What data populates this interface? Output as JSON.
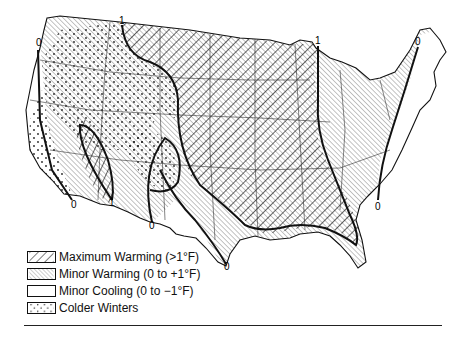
{
  "map": {
    "subject": "Contiguous United States temperature change zones",
    "contour_labels": [
      {
        "text": "0",
        "x": 39,
        "y": 46
      },
      {
        "text": "1",
        "x": 122,
        "y": 25
      },
      {
        "text": "1",
        "x": 318,
        "y": 44
      },
      {
        "text": "0",
        "x": 418,
        "y": 45
      },
      {
        "text": "0",
        "x": 74,
        "y": 205
      },
      {
        "text": "1",
        "x": 112,
        "y": 203
      },
      {
        "text": "0",
        "x": 152,
        "y": 226
      },
      {
        "text": "0",
        "x": 378,
        "y": 207
      },
      {
        "text": "0",
        "x": 227,
        "y": 267
      }
    ],
    "colors": {
      "line": "#111111",
      "background": "#ffffff"
    }
  },
  "legend": {
    "items": [
      {
        "key": "max-warming",
        "pattern": "wide-backslash-hatch",
        "label": "Maximum Warming (>1°F)"
      },
      {
        "key": "minor-warming",
        "pattern": "fine-slash-hatch",
        "label": "Minor Warming (0 to +1°F)"
      },
      {
        "key": "minor-cooling",
        "pattern": "blank",
        "label": "Minor Cooling (0 to −1°F)"
      },
      {
        "key": "colder-winters",
        "pattern": "dots",
        "label": "Colder Winters"
      }
    ]
  }
}
